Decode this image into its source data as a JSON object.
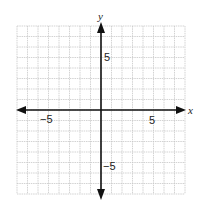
{
  "chart_data": {
    "type": "coordinate-plane",
    "title": "",
    "xlabel": "x",
    "ylabel": "y",
    "xlim": [
      -8,
      8
    ],
    "ylim": [
      -8,
      8
    ],
    "grid": true,
    "grid_step": 1,
    "tick_labels": {
      "x": [
        {
          "value": -5,
          "label": "−5"
        },
        {
          "value": 5,
          "label": "5"
        }
      ],
      "y": [
        {
          "value": 5,
          "label": "5"
        },
        {
          "value": -5,
          "label": "−5"
        }
      ]
    },
    "axes_arrows": true,
    "series": []
  },
  "labels": {
    "x_axis": "x",
    "y_axis": "y",
    "x_neg5": "−5",
    "x_pos5": "5",
    "y_pos5": "5",
    "y_neg5": "−5"
  },
  "colors": {
    "grid": "#c8c8c8",
    "axis": "#111111",
    "text": "#222222"
  }
}
